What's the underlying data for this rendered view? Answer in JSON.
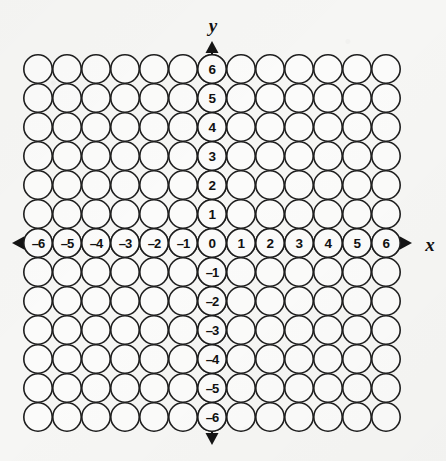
{
  "figure": {
    "background_color": "#f6f6f4",
    "ink_color": "#1d1d1d",
    "circle_fill": "#fbfbfa"
  },
  "axes": {
    "x_axis_label": "x",
    "y_axis_label": "y",
    "x_arrow_left_icon": "arrow-left-icon",
    "x_arrow_right_icon": "arrow-right-icon",
    "y_arrow_up_icon": "arrow-up-icon",
    "y_arrow_down_icon": "arrow-down-icon",
    "origin_label": "0"
  },
  "chart_data": {
    "type": "scatter",
    "xlabel": "x",
    "ylabel": "y",
    "grid": true,
    "legend": null,
    "xlim": [
      -6,
      6
    ],
    "ylim": [
      -6,
      6
    ],
    "columns": 13,
    "rows": 13,
    "x_tick_labels": [
      "–6",
      "–5",
      "–4",
      "–3",
      "–2",
      "–1",
      "0",
      "1",
      "2",
      "3",
      "4",
      "5",
      "6"
    ],
    "y_tick_labels": [
      "6",
      "5",
      "4",
      "3",
      "2",
      "1",
      "0",
      "–1",
      "–2",
      "–3",
      "–4",
      "–5",
      "–6"
    ],
    "x_values": [
      -6,
      -5,
      -4,
      -3,
      -2,
      -1,
      0,
      1,
      2,
      3,
      4,
      5,
      6
    ],
    "y_values": [
      6,
      5,
      4,
      3,
      2,
      1,
      0,
      -1,
      -2,
      -3,
      -4,
      -5,
      -6
    ],
    "marker": "open-circle",
    "marker_count": 169,
    "labeled_markers": [
      {
        "x": -6,
        "y": 0,
        "label": "–6"
      },
      {
        "x": -5,
        "y": 0,
        "label": "–5"
      },
      {
        "x": -4,
        "y": 0,
        "label": "–4"
      },
      {
        "x": -3,
        "y": 0,
        "label": "–3"
      },
      {
        "x": -2,
        "y": 0,
        "label": "–2"
      },
      {
        "x": -1,
        "y": 0,
        "label": "–1"
      },
      {
        "x": 0,
        "y": 0,
        "label": "0"
      },
      {
        "x": 1,
        "y": 0,
        "label": "1"
      },
      {
        "x": 2,
        "y": 0,
        "label": "2"
      },
      {
        "x": 3,
        "y": 0,
        "label": "3"
      },
      {
        "x": 4,
        "y": 0,
        "label": "4"
      },
      {
        "x": 5,
        "y": 0,
        "label": "5"
      },
      {
        "x": 6,
        "y": 0,
        "label": "6"
      },
      {
        "x": 0,
        "y": 6,
        "label": "6"
      },
      {
        "x": 0,
        "y": 5,
        "label": "5"
      },
      {
        "x": 0,
        "y": 4,
        "label": "4"
      },
      {
        "x": 0,
        "y": 3,
        "label": "3"
      },
      {
        "x": 0,
        "y": 2,
        "label": "2"
      },
      {
        "x": 0,
        "y": 1,
        "label": "1"
      },
      {
        "x": 0,
        "y": -1,
        "label": "–1"
      },
      {
        "x": 0,
        "y": -2,
        "label": "–2"
      },
      {
        "x": 0,
        "y": -3,
        "label": "–3"
      },
      {
        "x": 0,
        "y": -4,
        "label": "–4"
      },
      {
        "x": 0,
        "y": -5,
        "label": "–5"
      },
      {
        "x": 0,
        "y": -6,
        "label": "–6"
      }
    ]
  },
  "geometry": {
    "origin_px_x": 212,
    "origin_px_y": 243,
    "spacing_px": 29,
    "radius_px": 14.2
  }
}
